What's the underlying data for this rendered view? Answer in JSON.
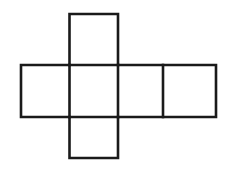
{
  "figure": {
    "background_color": "#ffffff",
    "stroke_color": "#1a1a1a",
    "fill_color": "#ffffff",
    "stroke_width": 2.6,
    "canvas": {
      "width": 237,
      "height": 171
    }
  },
  "chart_data": {
    "type": "diagram",
    "shape": "cube-net-cross",
    "face_count": 6,
    "unit_cell": {
      "width": 48.5,
      "height": 52
    },
    "grid": {
      "x_lines": [
        21,
        69.5,
        118,
        163,
        216
      ],
      "y_lines": [
        14,
        65,
        117,
        158
      ]
    },
    "faces": [
      {
        "id": "face-top",
        "role": "top",
        "x": 69.5,
        "y": 14,
        "width": 48.5,
        "height": 51
      },
      {
        "id": "face-row-left",
        "role": "left",
        "x": 21,
        "y": 65,
        "width": 48.5,
        "height": 52
      },
      {
        "id": "face-row-center",
        "role": "front",
        "x": 69.5,
        "y": 65,
        "width": 48.5,
        "height": 52
      },
      {
        "id": "face-row-right",
        "role": "right",
        "x": 118,
        "y": 65,
        "width": 45,
        "height": 52
      },
      {
        "id": "face-row-far-right",
        "role": "back",
        "x": 163,
        "y": 65,
        "width": 53,
        "height": 52
      },
      {
        "id": "face-bottom",
        "role": "bottom",
        "x": 69.5,
        "y": 117,
        "width": 48.5,
        "height": 41
      }
    ],
    "outline_path": "M 69.5 14 L 118 14 L 118 65 L 216 65 L 216 117 L 118 117 L 118 158 L 69.5 158 L 69.5 117 L 21 117 L 21 65 L 69.5 65 Z",
    "interior_segments": [
      {
        "id": "seg-h-top",
        "orientation": "horizontal",
        "x1": 69.5,
        "y1": 65,
        "x2": 118,
        "y2": 65
      },
      {
        "id": "seg-h-bottom",
        "orientation": "horizontal",
        "x1": 69.5,
        "y1": 117,
        "x2": 118,
        "y2": 117
      },
      {
        "id": "seg-v-left",
        "orientation": "vertical",
        "x1": 69.5,
        "y1": 65,
        "x2": 69.5,
        "y2": 117
      },
      {
        "id": "seg-v-mid",
        "orientation": "vertical",
        "x1": 118,
        "y1": 65,
        "x2": 118,
        "y2": 117
      },
      {
        "id": "seg-v-right",
        "orientation": "vertical",
        "x1": 163,
        "y1": 65,
        "x2": 163,
        "y2": 117
      }
    ],
    "labels": [],
    "annotations": [],
    "grid_visible": true,
    "legend": null,
    "xlabel": "",
    "ylabel": ""
  }
}
